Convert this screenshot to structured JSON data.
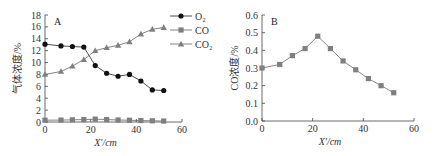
{
  "chart_data": [
    {
      "panel": "A",
      "type": "line",
      "title": "",
      "xlabel": "X'/cm",
      "ylabel": "气体浓度/%",
      "xlim": [
        0,
        60
      ],
      "ylim": [
        0,
        18
      ],
      "xticks": [
        0,
        20,
        40,
        60
      ],
      "yticks": [
        0,
        2,
        4,
        6,
        8,
        10,
        12,
        14,
        16,
        18
      ],
      "grid": false,
      "legend_position": "upper right, outside plot",
      "x": [
        0,
        7,
        12,
        17,
        22,
        27,
        32,
        37,
        42,
        47,
        52
      ],
      "series": [
        {
          "name": "O2",
          "marker": "circle",
          "color": "#111111",
          "values": [
            13.1,
            12.8,
            12.7,
            12.6,
            9.5,
            8.2,
            7.7,
            8.0,
            6.9,
            5.4,
            5.3
          ]
        },
        {
          "name": "CO",
          "marker": "square",
          "color": "#7f7f7f",
          "values": [
            0.3,
            0.32,
            0.37,
            0.41,
            0.48,
            0.41,
            0.34,
            0.29,
            0.24,
            0.2,
            0.16
          ]
        },
        {
          "name": "CO2",
          "marker": "triangle",
          "color": "#7f7f7f",
          "values": [
            8.0,
            8.5,
            9.4,
            10.5,
            12.0,
            12.5,
            12.9,
            13.5,
            14.8,
            15.6,
            15.9
          ]
        }
      ]
    },
    {
      "panel": "B",
      "type": "line",
      "title": "",
      "xlabel": "X'/cm",
      "ylabel": "CO浓度/%",
      "xlim": [
        0,
        60
      ],
      "ylim": [
        0.0,
        0.6
      ],
      "xticks": [
        0,
        20,
        40,
        60
      ],
      "yticks": [
        0.0,
        0.1,
        0.2,
        0.3,
        0.4,
        0.5,
        0.6
      ],
      "grid": false,
      "x": [
        0,
        7,
        12,
        17,
        22,
        27,
        32,
        37,
        42,
        47,
        52
      ],
      "series": [
        {
          "name": "CO",
          "marker": "square",
          "color": "#7f7f7f",
          "values": [
            0.3,
            0.32,
            0.37,
            0.41,
            0.48,
            0.41,
            0.34,
            0.29,
            0.24,
            0.2,
            0.16
          ]
        }
      ]
    }
  ],
  "labels": {
    "panelA": "A",
    "panelB": "B",
    "xlabelA": "X'/cm",
    "xlabelB": "X'/cm",
    "ylabelA": "气体浓度/%",
    "ylabelB": "CO浓度/%",
    "legend": [
      "O₂",
      "CO",
      "CO₂"
    ],
    "yticksA": [
      "0",
      "2",
      "4",
      "6",
      "8",
      "10",
      "12",
      "14",
      "16",
      "18"
    ],
    "yticksB": [
      "0.0",
      "0.1",
      "0.2",
      "0.3",
      "0.4",
      "0.5",
      "0.6"
    ],
    "xticks": [
      "0",
      "20",
      "40",
      "60"
    ]
  }
}
